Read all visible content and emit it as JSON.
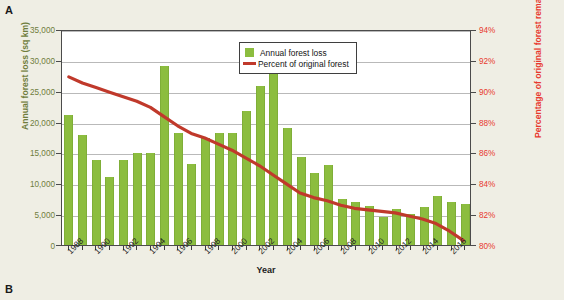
{
  "panels": {
    "a_label": "A",
    "b_label": "B"
  },
  "chart_data": {
    "type": "bar",
    "title": "",
    "subtitle": "",
    "xlabel": "Year",
    "ylabel": "Annual forest loss (sq km)",
    "ylabel_secondary": "Percentage of original forest remaining",
    "grid": true,
    "legend_position": "top-right",
    "x": [
      1988,
      1989,
      1990,
      1991,
      1992,
      1993,
      1994,
      1995,
      1996,
      1997,
      1998,
      1999,
      2000,
      2001,
      2002,
      2003,
      2004,
      2005,
      2006,
      2007,
      2008,
      2009,
      2010,
      2011,
      2012,
      2013,
      2014,
      2015,
      2016,
      2017
    ],
    "categories": [
      "1988",
      "1989",
      "1990",
      "1991",
      "1992",
      "1993",
      "1994",
      "1995",
      "1996",
      "1997",
      "1998",
      "1999",
      "2000",
      "2001",
      "2002",
      "2003",
      "2004",
      "2005",
      "2006",
      "2007",
      "2008",
      "2009",
      "2010",
      "2011",
      "2012",
      "2013",
      "2014",
      "2015",
      "2016",
      "2017"
    ],
    "xtick_labels": [
      "1988",
      "1990",
      "1992",
      "1994",
      "1996",
      "1998",
      "2000",
      "2002",
      "2004",
      "2006",
      "2008",
      "2010",
      "2012",
      "2014",
      "2016"
    ],
    "xtick_values": [
      1988,
      1990,
      1992,
      1994,
      1996,
      1998,
      2000,
      2002,
      2004,
      2006,
      2008,
      2010,
      2012,
      2014,
      2016
    ],
    "ylim": [
      0,
      35000
    ],
    "ytick_labels": [
      "0",
      "5,000",
      "10,000",
      "15,000",
      "20,000",
      "25,000",
      "30,000",
      "35,000"
    ],
    "ytick_values": [
      0,
      5000,
      10000,
      15000,
      20000,
      25000,
      30000,
      35000
    ],
    "ylim_secondary": [
      80,
      94
    ],
    "ytick_labels_secondary": [
      "80%",
      "82%",
      "84%",
      "86%",
      "88%",
      "90%",
      "92%",
      "94%"
    ],
    "ytick_values_secondary": [
      80,
      82,
      84,
      86,
      88,
      90,
      92,
      94
    ],
    "series": [
      {
        "name": "Annual forest loss",
        "type": "bar",
        "axis": "left",
        "color": "#8cbd3f",
        "values": [
          21000,
          17800,
          13700,
          11000,
          13800,
          14900,
          14900,
          29000,
          18200,
          13100,
          17300,
          18200,
          18200,
          21700,
          25700,
          27800,
          19000,
          14300,
          11700,
          13000,
          7500,
          7000,
          6400,
          4600,
          5900,
          5000,
          6200,
          7900,
          6900,
          6600
        ]
      },
      {
        "name": "Percent of original forest",
        "type": "line",
        "axis": "right",
        "color": "#c0392b",
        "values": [
          91.0,
          90.6,
          90.3,
          90.0,
          89.7,
          89.4,
          89.0,
          88.4,
          87.8,
          87.3,
          87.0,
          86.6,
          86.2,
          85.7,
          85.2,
          84.6,
          84.0,
          83.4,
          83.1,
          82.9,
          82.6,
          82.4,
          82.3,
          82.2,
          82.1,
          81.9,
          81.7,
          81.4,
          80.9,
          80.3
        ]
      }
    ],
    "legend": [
      {
        "label": "Annual forest loss",
        "marker": "square",
        "color": "#8cbd3f"
      },
      {
        "label": "Percent of original forest",
        "marker": "line",
        "color": "#c0392b"
      }
    ]
  },
  "colors": {
    "bar_green": "#8cbd3f",
    "line_red": "#c0392b",
    "left_axis_text": "#6f7d3c",
    "right_axis_text": "#e8392e",
    "page_background": "#efeee4",
    "plot_background": "#ffffff"
  }
}
